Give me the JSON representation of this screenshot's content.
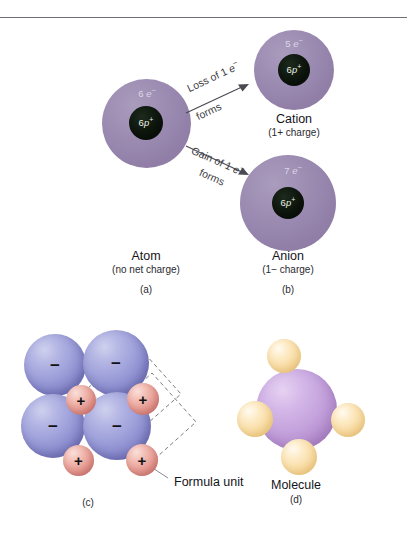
{
  "figure": {
    "background_color": "#ffffff",
    "divider_color": "#6f6f78"
  },
  "panel_a": {
    "letter": "(a)",
    "title": "Atom",
    "subtitle": "(no net charge)",
    "electron_label_count": "6",
    "electron_label_symbol": "e",
    "electron_label_charge": "−",
    "nucleus_label_count": "6",
    "nucleus_label_symbol": "p",
    "nucleus_label_charge": "+",
    "shell_color": "#9c8cb2",
    "nucleus_color": "#0b130b"
  },
  "panel_b_cation": {
    "title": "Cation",
    "subtitle": "(1+ charge)",
    "electron_label_count": "5",
    "electron_label_symbol": "e",
    "electron_label_charge": "−",
    "nucleus_label_count": "6",
    "nucleus_label_symbol": "p",
    "nucleus_label_charge": "+"
  },
  "panel_b_anion": {
    "letter": "(b)",
    "title": "Anion",
    "subtitle": "(1−  charge)",
    "electron_label_count": "7",
    "electron_label_symbol": "e",
    "electron_label_charge": "−",
    "nucleus_label_count": "6",
    "nucleus_label_symbol": "p",
    "nucleus_label_charge": "+"
  },
  "arrow_loss": {
    "line1_pre": "Loss of 1 ",
    "line1_symbol": "e",
    "line1_charge": "−",
    "line2": "forms"
  },
  "arrow_gain": {
    "line1_pre": "Gain of 1 ",
    "line1_symbol": "e",
    "line1_charge": "−",
    "line2": "forms"
  },
  "panel_c": {
    "letter": "(c)",
    "callout_label": "Formula unit",
    "anion_sign": "−",
    "cation_sign": "+",
    "anion_color": "#9a9cd8",
    "cation_color": "#e79c93",
    "anion_count": 4,
    "cation_count": 4
  },
  "panel_d": {
    "letter": "(d)",
    "title": "Molecule",
    "center_color": "#c4a2dc",
    "satellite_color": "#f9dda6",
    "satellite_count": 4
  }
}
